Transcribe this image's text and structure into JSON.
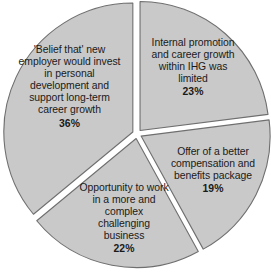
{
  "chart_data": {
    "type": "pie",
    "title": "",
    "subtitle": "",
    "xlabel": "",
    "ylabel": "",
    "grid": false,
    "legend_position": "none",
    "labels_inside_slices": true,
    "value_suffix": "%",
    "fill_color": "#c9c9c9",
    "stroke_color": "#6f6f6f",
    "background_color": "#ffffff",
    "text_color": "#1a1a1a",
    "start_angle_deg": 0,
    "direction": "clockwise",
    "categories": [
      "Internal promotion and career growth within IHG was limited",
      "Offer of a better compensation and benefits package",
      "Opportunity to work in a more and complex challenging business",
      "'Belief that' new employer would invest in personal development and support long-term career growth"
    ],
    "values": [
      23,
      19,
      22,
      36
    ],
    "slices": [
      {
        "name": "internal-promotion",
        "label": "Internal promotion and career growth within IHG was limited",
        "value": 23,
        "value_text": "23%",
        "start_deg": 0,
        "end_deg": 82.8
      },
      {
        "name": "better-compensation",
        "label": "Offer of a better compensation and benefits package",
        "value": 19,
        "value_text": "19%",
        "start_deg": 82.8,
        "end_deg": 151.2
      },
      {
        "name": "challenging-business",
        "label": "Opportunity to work in a more and complex challenging business",
        "value": 22,
        "value_text": "22%",
        "start_deg": 151.2,
        "end_deg": 230.4
      },
      {
        "name": "belief-development",
        "label": "'Belief that' new employer would invest in personal development and support long-term career growth",
        "value": 36,
        "value_text": "36%",
        "start_deg": 230.4,
        "end_deg": 360
      }
    ]
  }
}
